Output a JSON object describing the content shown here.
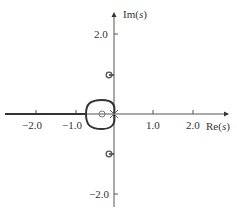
{
  "diagram": {
    "type": "root-locus",
    "axes": {
      "x_label_prefix": "Re(",
      "x_label_var": "s",
      "x_label_suffix": ")",
      "y_label_prefix": "Im(",
      "y_label_var": "s",
      "y_label_suffix": ")",
      "x_ticks": [
        "−2.0",
        "−1.0",
        "1.0",
        "2.0"
      ],
      "y_ticks": [
        "2.0",
        "−2.0"
      ]
    },
    "poles": [
      {
        "re": 0,
        "im": 0,
        "symbol": "×"
      }
    ],
    "zeros": [
      {
        "re": -0.33,
        "im": 0,
        "symbol": "○"
      },
      {
        "re": -0.3,
        "im": 1.0,
        "symbol": "○"
      },
      {
        "re": -0.3,
        "im": -1.0,
        "symbol": "○"
      }
    ],
    "colors": {
      "locus": "#333333",
      "axes": "#555555",
      "markers": "#777777"
    }
  }
}
